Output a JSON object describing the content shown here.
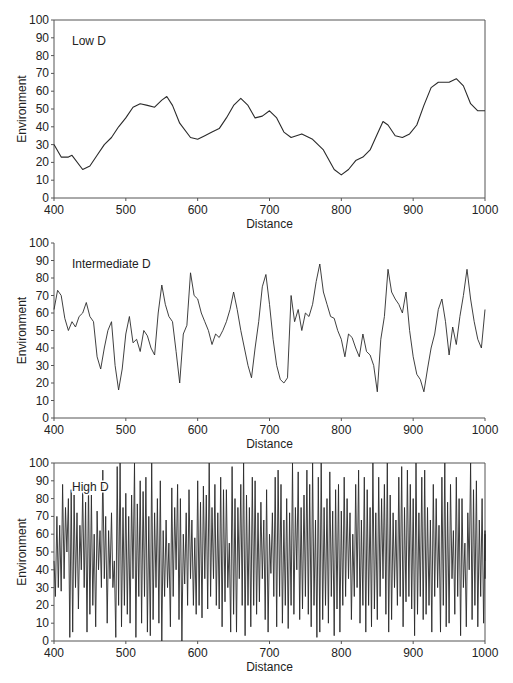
{
  "chart_data": [
    {
      "type": "line",
      "title": "Low D",
      "xlabel": "Distance",
      "ylabel": "Environment",
      "xlim": [
        400,
        1000
      ],
      "ylim": [
        0,
        100
      ],
      "xticks": [
        400,
        500,
        600,
        700,
        800,
        900,
        1000
      ],
      "yticks": [
        0,
        10,
        20,
        30,
        40,
        50,
        60,
        70,
        80,
        90,
        100
      ],
      "frame": "box",
      "grid": false,
      "series": [
        {
          "name": "Low D",
          "x": [
            400,
            410,
            420,
            425,
            440,
            450,
            460,
            470,
            480,
            490,
            500,
            510,
            520,
            530,
            540,
            550,
            557,
            565,
            575,
            590,
            600,
            610,
            620,
            630,
            640,
            650,
            660,
            670,
            680,
            690,
            700,
            710,
            720,
            730,
            745,
            760,
            775,
            790,
            800,
            810,
            820,
            830,
            840,
            850,
            858,
            865,
            875,
            885,
            895,
            905,
            915,
            925,
            935,
            950,
            960,
            970,
            980,
            990,
            1000
          ],
          "y": [
            30,
            23,
            23,
            24,
            16,
            18,
            24,
            30,
            34,
            40,
            45,
            51,
            53,
            52,
            51,
            55,
            57,
            52,
            42,
            34,
            33,
            35,
            37,
            39,
            45,
            52,
            56,
            52,
            45,
            46,
            49,
            45,
            37,
            34,
            36,
            33,
            27,
            16,
            13,
            16,
            21,
            23,
            27,
            36,
            43,
            41,
            35,
            34,
            36,
            41,
            52,
            62,
            65,
            65,
            67,
            63,
            53,
            49,
            49
          ]
        }
      ]
    },
    {
      "type": "line",
      "title": "Intermediate D",
      "xlabel": "Distance",
      "ylabel": "Environment",
      "xlim": [
        400,
        1000
      ],
      "ylim": [
        0,
        100
      ],
      "xticks": [
        400,
        500,
        600,
        700,
        800,
        900,
        1000
      ],
      "yticks": [
        0,
        10,
        20,
        30,
        40,
        50,
        60,
        70,
        80,
        90,
        100
      ],
      "frame": "left-bottom",
      "grid": false,
      "series": [
        {
          "name": "Intermediate D",
          "x": [
            400,
            405,
            410,
            415,
            420,
            425,
            430,
            435,
            440,
            445,
            450,
            455,
            460,
            465,
            470,
            475,
            480,
            485,
            490,
            495,
            500,
            505,
            510,
            515,
            520,
            525,
            530,
            535,
            540,
            545,
            550,
            555,
            560,
            565,
            570,
            575,
            580,
            585,
            590,
            595,
            600,
            605,
            610,
            615,
            620,
            625,
            630,
            635,
            640,
            645,
            650,
            655,
            660,
            665,
            670,
            675,
            680,
            685,
            690,
            695,
            700,
            705,
            710,
            715,
            720,
            725,
            730,
            735,
            740,
            745,
            750,
            755,
            760,
            765,
            770,
            775,
            780,
            785,
            790,
            795,
            800,
            805,
            810,
            815,
            820,
            825,
            830,
            835,
            840,
            845,
            850,
            855,
            860,
            865,
            870,
            875,
            880,
            885,
            890,
            895,
            900,
            905,
            910,
            915,
            920,
            925,
            930,
            935,
            940,
            945,
            950,
            955,
            960,
            965,
            970,
            975,
            980,
            985,
            990,
            995,
            1000
          ],
          "y": [
            62,
            73,
            70,
            57,
            50,
            55,
            52,
            58,
            60,
            66,
            58,
            55,
            35,
            28,
            40,
            50,
            55,
            30,
            16,
            28,
            48,
            58,
            43,
            45,
            38,
            50,
            47,
            40,
            36,
            60,
            76,
            65,
            58,
            55,
            38,
            20,
            48,
            53,
            83,
            70,
            68,
            60,
            55,
            50,
            42,
            48,
            46,
            50,
            55,
            62,
            72,
            62,
            50,
            40,
            30,
            23,
            40,
            55,
            75,
            82,
            65,
            45,
            30,
            22,
            20,
            23,
            70,
            55,
            62,
            50,
            60,
            58,
            65,
            78,
            88,
            72,
            65,
            58,
            57,
            50,
            45,
            35,
            48,
            46,
            40,
            35,
            48,
            38,
            36,
            30,
            15,
            45,
            58,
            85,
            72,
            68,
            65,
            60,
            72,
            50,
            35,
            25,
            22,
            15,
            28,
            40,
            48,
            62,
            68,
            55,
            36,
            52,
            42,
            58,
            70,
            85,
            68,
            55,
            45,
            40,
            62
          ]
        }
      ]
    },
    {
      "type": "line",
      "title": "High D",
      "xlabel": "Distance",
      "ylabel": "Environment",
      "xlim": [
        400,
        1000
      ],
      "ylim": [
        0,
        100
      ],
      "xticks": [
        400,
        500,
        600,
        700,
        800,
        900,
        1000
      ],
      "yticks": [
        0,
        10,
        20,
        30,
        40,
        50,
        60,
        70,
        80,
        90,
        100
      ],
      "frame": "box",
      "grid": false,
      "series": [
        {
          "name": "High D",
          "x_start": 400,
          "x_step": 2,
          "y": [
            45,
            25,
            70,
            30,
            65,
            28,
            88,
            35,
            75,
            50,
            80,
            2,
            85,
            5,
            82,
            30,
            72,
            18,
            65,
            40,
            85,
            30,
            78,
            5,
            88,
            15,
            82,
            20,
            60,
            8,
            73,
            40,
            62,
            30,
            96,
            35,
            70,
            10,
            62,
            35,
            72,
            30,
            45,
            2,
            98,
            20,
            100,
            8,
            75,
            20,
            83,
            15,
            70,
            10,
            82,
            35,
            100,
            2,
            77,
            25,
            90,
            10,
            84,
            25,
            92,
            5,
            70,
            3,
            100,
            12,
            72,
            30,
            80,
            10,
            90,
            0,
            62,
            25,
            68,
            30,
            55,
            8,
            86,
            25,
            75,
            40,
            88,
            12,
            80,
            0,
            60,
            32,
            72,
            20,
            85,
            35,
            68,
            20,
            58,
            15,
            90,
            20,
            78,
            13,
            87,
            35,
            82,
            18,
            100,
            25,
            75,
            35,
            88,
            20,
            72,
            18,
            92,
            8,
            85,
            22,
            85,
            30,
            55,
            5,
            98,
            15,
            80,
            5,
            75,
            35,
            88,
            20,
            100,
            3,
            82,
            20,
            75,
            8,
            92,
            20,
            90,
            15,
            72,
            22,
            78,
            35,
            68,
            12,
            85,
            5,
            60,
            38,
            72,
            25,
            92,
            8,
            96,
            25,
            88,
            10,
            68,
            20,
            80,
            7,
            72,
            20,
            100,
            15,
            75,
            40,
            95,
            12,
            75,
            18,
            82,
            25,
            96,
            15,
            88,
            8,
            100,
            20,
            68,
            2,
            92,
            5,
            100,
            12,
            75,
            20,
            80,
            10,
            95,
            25,
            73,
            3,
            85,
            18,
            88,
            5,
            73,
            20,
            92,
            25,
            80,
            35,
            72,
            12,
            60,
            25,
            88,
            30,
            96,
            10,
            68,
            20,
            92,
            5,
            85,
            20,
            75,
            8,
            100,
            18,
            72,
            12,
            92,
            25,
            80,
            35,
            88,
            15,
            100,
            5,
            82,
            12,
            72,
            30,
            68,
            20,
            92,
            25,
            98,
            8,
            75,
            22,
            96,
            25,
            88,
            18,
            80,
            3,
            100,
            15,
            72,
            25,
            92,
            12,
            96,
            15,
            75,
            20,
            68,
            5,
            88,
            25,
            80,
            30,
            65,
            5,
            92,
            20,
            100,
            8,
            78,
            10,
            88,
            35,
            62,
            15,
            92,
            25,
            80,
            3,
            80,
            30,
            55,
            8,
            72,
            40,
            100,
            12,
            85,
            20,
            90,
            8,
            68,
            25,
            80,
            10,
            62,
            35,
            60,
            45
          ]
        }
      ]
    }
  ],
  "panels": [
    {
      "title": "Low D",
      "xlabel": "Distance",
      "ylabel": "Environment"
    },
    {
      "title": "Intermediate D",
      "xlabel": "Distance",
      "ylabel": "Environment"
    },
    {
      "title": "High D",
      "xlabel": "Distance",
      "ylabel": "Environment"
    }
  ],
  "style": {
    "line_color": "#2a2a2a",
    "axis_color": "#555555",
    "background": "#ffffff"
  }
}
